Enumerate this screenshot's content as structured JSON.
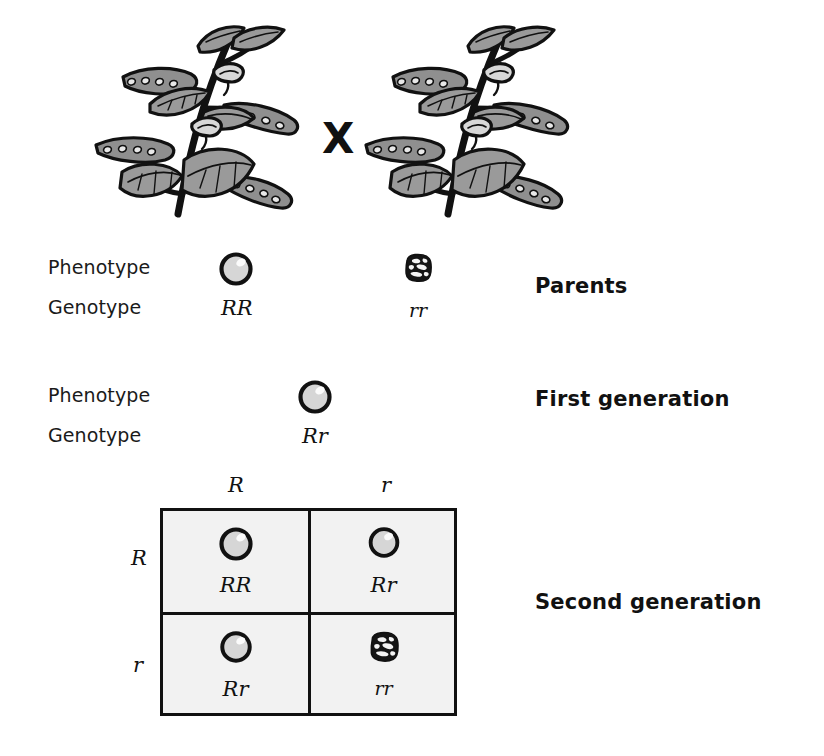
{
  "figure": {
    "cross_symbol": "X"
  },
  "colors": {
    "ink": "#111111",
    "leaf_fill": "#9a9a9a",
    "seed_fill": "#d6d6d6",
    "cell_fill": "#f2f2f2"
  },
  "parents": {
    "phenotype_label": "Phenotype",
    "genotype_label": "Genotype",
    "stage_label": "Parents",
    "left": {
      "genotype": "RR",
      "phenotype": "round-seed-icon"
    },
    "right": {
      "genotype": "rr",
      "phenotype": "wrinkled-seed-icon"
    }
  },
  "first_generation": {
    "phenotype_label": "Phenotype",
    "genotype_label": "Genotype",
    "stage_label": "First generation",
    "offspring": {
      "genotype": "Rr",
      "phenotype": "round-seed-icon"
    }
  },
  "second_generation": {
    "stage_label": "Second generation",
    "column_headers": [
      "R",
      "r"
    ],
    "row_headers": [
      "R",
      "r"
    ],
    "cells": [
      {
        "genotype": "RR",
        "phenotype": "round-seed-icon"
      },
      {
        "genotype": "Rr",
        "phenotype": "round-seed-icon"
      },
      {
        "genotype": "Rr",
        "phenotype": "round-seed-icon"
      },
      {
        "genotype": "rr",
        "phenotype": "wrinkled-seed-icon"
      }
    ]
  }
}
